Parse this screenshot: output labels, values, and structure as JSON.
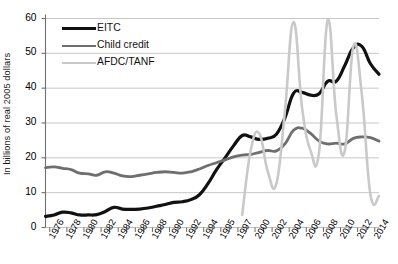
{
  "axes": {
    "ylabel": "In billions of real 2005 dollars",
    "yticks": [
      "0",
      "10",
      "20",
      "30",
      "40",
      "50",
      "60"
    ],
    "ytick_values": [
      0,
      10,
      20,
      30,
      40,
      50,
      60
    ],
    "ylim": [
      0,
      60
    ],
    "xlabel": "",
    "xtick_labels": [
      "1976",
      "1978",
      "1980",
      "1982",
      "1984",
      "1986",
      "1988",
      "1990",
      "1992",
      "1994",
      "1995",
      "1997",
      "2000",
      "2002",
      "2004",
      "2006",
      "2008",
      "2010",
      "2012",
      "2014"
    ],
    "grid": "horizontal"
  },
  "legend": {
    "position": "top-left-inside",
    "items": [
      {
        "label": "EITC",
        "color": "#111111",
        "width": 3.2
      },
      {
        "label": "Child credit",
        "color": "#6e6e6e",
        "width": 2.8
      },
      {
        "label": "AFDC/TANF",
        "color": "#c9c9c9",
        "width": 2.6
      }
    ]
  },
  "chart_data": {
    "type": "line",
    "title": "",
    "subtitle": "",
    "xlabel": "",
    "ylabel": "In billions of real 2005 dollars",
    "ylim": [
      0,
      60
    ],
    "grid": true,
    "legend_position": "top-left-inside",
    "x": [
      1976,
      1977,
      1978,
      1979,
      1980,
      1981,
      1982,
      1983,
      1984,
      1985,
      1986,
      1987,
      1988,
      1989,
      1990,
      1991,
      1992,
      1993,
      1994,
      1995,
      1996,
      1997,
      1998,
      1999,
      2000,
      2001,
      2002,
      2003,
      2004,
      2005,
      2006,
      2007,
      2008,
      2009,
      2010,
      2011,
      2012,
      2013,
      2014,
      2015
    ],
    "series": [
      {
        "name": "EITC",
        "color": "#111111",
        "values": [
          3.2,
          3.6,
          4.4,
          4.2,
          3.6,
          3.6,
          3.7,
          4.6,
          5.8,
          5.3,
          5.2,
          5.3,
          5.6,
          6.1,
          6.6,
          7.2,
          7.4,
          8.0,
          9.4,
          12.6,
          16.6,
          20.0,
          23.5,
          26.4,
          26.0,
          25.3,
          25.6,
          26.8,
          31.5,
          38.5,
          38.8,
          38.0,
          38.4,
          42.0,
          42.0,
          46.5,
          51.6,
          52.0,
          47.0,
          44.0
        ]
      },
      {
        "name": "Child credit",
        "color": "#6e6e6e",
        "values": [
          17.2,
          17.4,
          17.0,
          16.6,
          15.6,
          15.4,
          15.0,
          16.0,
          15.6,
          14.8,
          14.6,
          15.0,
          15.4,
          15.8,
          16.0,
          15.8,
          15.6,
          16.0,
          16.8,
          17.8,
          18.6,
          19.4,
          20.3,
          20.8,
          21.0,
          21.6,
          22.1,
          22.0,
          24.0,
          27.9,
          28.5,
          27.0,
          24.8,
          24.0,
          24.2,
          24.0,
          25.6,
          26.0,
          25.8,
          24.8
        ]
      },
      {
        "name": "AFDC/TANF",
        "color": "#c9c9c9",
        "values": [
          null,
          null,
          null,
          null,
          null,
          null,
          null,
          null,
          null,
          null,
          null,
          null,
          null,
          null,
          null,
          null,
          null,
          null,
          null,
          null,
          null,
          null,
          null,
          3.6,
          22.2,
          27.0,
          16.0,
          12.6,
          33.5,
          59.0,
          34.5,
          22.0,
          21.8,
          59.5,
          32.5,
          22.0,
          52.0,
          38.0,
          9.4,
          9.0
        ]
      }
    ]
  }
}
